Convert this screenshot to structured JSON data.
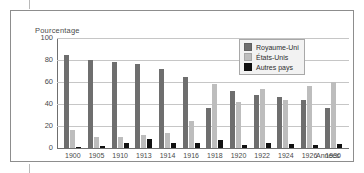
{
  "frame": {
    "y_axis_title": "Pourcentage",
    "x_axis_title": "Années"
  },
  "legend": {
    "items": [
      {
        "label": "Royaume-Uni",
        "color": "#6e6e6e",
        "key": "uk"
      },
      {
        "label": "États-Unis",
        "color": "#bdbdbd",
        "key": "us"
      },
      {
        "label": "Autres pays",
        "color": "#111111",
        "key": "other"
      }
    ]
  },
  "chart_data": {
    "type": "bar",
    "title": "",
    "subtitle": "",
    "xlabel": "Années",
    "ylabel": "Pourcentage",
    "ylim": [
      0,
      100
    ],
    "yticks": [
      0,
      20,
      40,
      60,
      80,
      100
    ],
    "ytick_labels": [
      "0",
      "20",
      "40",
      "60",
      "80",
      "100"
    ],
    "grid": true,
    "legend_position": "top-right",
    "categories": [
      "1900",
      "1905",
      "1910",
      "1913",
      "1914",
      "1916",
      "1918",
      "1920",
      "1922",
      "1924",
      "1926",
      "1930"
    ],
    "series": [
      {
        "name": "Royaume-Uni",
        "color": "#6e6e6e",
        "values": [
          85,
          80,
          78,
          76,
          72,
          65,
          36,
          52,
          48,
          46,
          44,
          36
        ]
      },
      {
        "name": "États-Unis",
        "color": "#bdbdbd",
        "values": [
          16,
          10,
          10,
          12,
          14,
          25,
          58,
          42,
          54,
          44,
          56,
          60
        ]
      },
      {
        "name": "Autres pays",
        "color": "#111111",
        "values": [
          1,
          2,
          5,
          8,
          5,
          5,
          7,
          3,
          5,
          4,
          3,
          4
        ]
      }
    ]
  }
}
